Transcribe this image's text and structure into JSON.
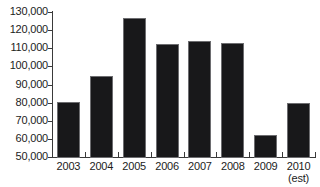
{
  "chart_data": {
    "type": "bar",
    "title": "",
    "subtitle": "",
    "xlabel": "",
    "ylabel": "",
    "categories": [
      "2003",
      "2004",
      "2005",
      "2006",
      "2007",
      "2008",
      "2009",
      "2010"
    ],
    "category_sublabels": [
      "",
      "",
      "",
      "",
      "",
      "",
      "",
      "(est)"
    ],
    "values": [
      80700,
      95400,
      127500,
      112700,
      114500,
      113700,
      62500,
      80200
    ],
    "ylim": [
      50000,
      130000
    ],
    "yticks": [
      50000,
      60000,
      70000,
      80000,
      90000,
      100000,
      110000,
      120000,
      130000
    ],
    "ytick_labels": [
      "50,000",
      "60,000",
      "70,000",
      "80,000",
      "90,000",
      "100,000",
      "110,000",
      "120,000",
      "130,000"
    ],
    "grid": false,
    "legend": null,
    "legend_position": "none",
    "bar_color": "#18181a",
    "bar_edge_color": "#6d6d70",
    "axis_color": "#3a3a3a",
    "text_color": "#1c1c1c",
    "background_color": "#ffffff"
  }
}
